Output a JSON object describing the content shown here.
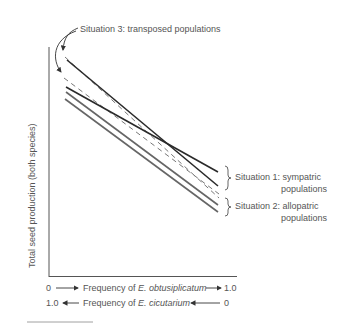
{
  "figure": {
    "y_axis_label": "Total seed production (both species)",
    "x_axis": {
      "row1": {
        "left": "0",
        "prefix": "Frequency of ",
        "species": "E. obtusiplicatum",
        "right": "1.0"
      },
      "row2": {
        "left": "1.0",
        "prefix": "Frequency of ",
        "species": "E. cicutarium",
        "right": "0"
      }
    },
    "annotations": {
      "situation3": "Situation 3: transposed populations",
      "situation1_line1": "Situation 1:  sympatric",
      "situation1_line2": "populations",
      "situation2_line1": "Situation 2:  allopatric",
      "situation2_line2": "populations"
    },
    "colors": {
      "dark_line": "#2a2a2a",
      "gray_line": "#6a6a6a",
      "dashed_line": "#777777",
      "axis": "#555555"
    }
  }
}
